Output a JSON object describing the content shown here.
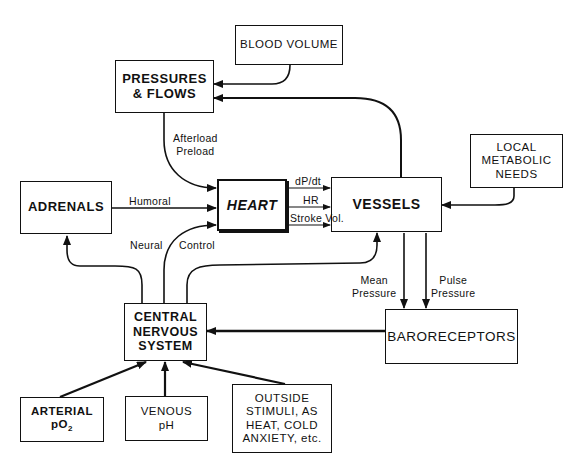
{
  "diagram": {
    "type": "block-flow",
    "nodes": {
      "blood_volume": {
        "lines": [
          "BLOOD VOLUME"
        ]
      },
      "pressures_flows": {
        "lines": [
          "PRESSURES",
          "& FLOWS"
        ]
      },
      "heart": {
        "lines": [
          "HEART"
        ]
      },
      "adrenals": {
        "lines": [
          "ADRENALS"
        ]
      },
      "vessels": {
        "lines": [
          "VESSELS"
        ]
      },
      "local_metabolic": {
        "lines": [
          "LOCAL",
          "METABOLIC",
          "NEEDS"
        ]
      },
      "baroreceptors": {
        "lines": [
          "BARORECEPTORS"
        ]
      },
      "cns": {
        "lines": [
          "CENTRAL",
          "NERVOUS",
          "SYSTEM"
        ]
      },
      "arterial": {
        "lines": [
          "ARTERIAL",
          "pO",
          "2"
        ]
      },
      "venous": {
        "lines": [
          "VENOUS",
          "pH"
        ]
      },
      "outside": {
        "lines": [
          "OUTSIDE",
          "STIMULI, AS",
          "HEAT, COLD",
          "ANXIETY, etc."
        ]
      }
    },
    "edge_labels": {
      "afterload": "Afterload",
      "preload": "Preload",
      "humoral": "Humoral",
      "neural": "Neural",
      "control": "Control",
      "dpdt": "dP/dt",
      "hr": "HR",
      "stroke_vol": "Stroke Vol.",
      "mean_1": "Mean",
      "mean_2": "Pressure",
      "pulse_1": "Pulse",
      "pulse_2": "Pressure"
    },
    "edges": [
      {
        "from": "Blood Volume",
        "to": "Pressures & Flows"
      },
      {
        "from": "Vessels",
        "to": "Pressures & Flows"
      },
      {
        "from": "Pressures & Flows",
        "to": "Heart",
        "label": "Afterload Preload"
      },
      {
        "from": "Adrenals",
        "to": "Heart",
        "label": "Humoral"
      },
      {
        "from": "Central Nervous System",
        "to": "Heart",
        "label": "Neural Control"
      },
      {
        "from": "Central Nervous System",
        "to": "Adrenals"
      },
      {
        "from": "Central Nervous System",
        "to": "Vessels"
      },
      {
        "from": "Heart",
        "to": "Vessels",
        "label": "dP/dt"
      },
      {
        "from": "Heart",
        "to": "Vessels",
        "label": "HR"
      },
      {
        "from": "Heart",
        "to": "Vessels",
        "label": "Stroke Vol."
      },
      {
        "from": "Local Metabolic Needs",
        "to": "Vessels"
      },
      {
        "from": "Vessels",
        "to": "Baroreceptors",
        "label": "Mean Pressure"
      },
      {
        "from": "Vessels",
        "to": "Baroreceptors",
        "label": "Pulse Pressure"
      },
      {
        "from": "Baroreceptors",
        "to": "Central Nervous System"
      },
      {
        "from": "Arterial pO2",
        "to": "Central Nervous System"
      },
      {
        "from": "Venous pH",
        "to": "Central Nervous System"
      },
      {
        "from": "Outside Stimuli",
        "to": "Central Nervous System"
      }
    ]
  }
}
